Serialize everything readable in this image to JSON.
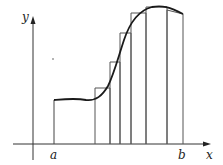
{
  "diagram": {
    "title": "",
    "axis_labels": {
      "x": "x",
      "y": "y"
    },
    "interval_labels": {
      "left": "a",
      "right": "b"
    },
    "colors": {
      "curve": "#1a1a1a",
      "axis": "#333333",
      "rect": "#555555",
      "background": "#ffffff"
    },
    "rectangles": [
      {
        "x0": 95,
        "x1": 110,
        "top": 88
      },
      {
        "x0": 110,
        "x1": 120,
        "top": 62
      },
      {
        "x0": 120,
        "x1": 131,
        "top": 33
      },
      {
        "x0": 131,
        "x1": 146,
        "top": 13
      },
      {
        "x0": 146,
        "x1": 167,
        "top": 7
      },
      {
        "x0": 167,
        "x1": 183,
        "top": 10
      }
    ]
  }
}
